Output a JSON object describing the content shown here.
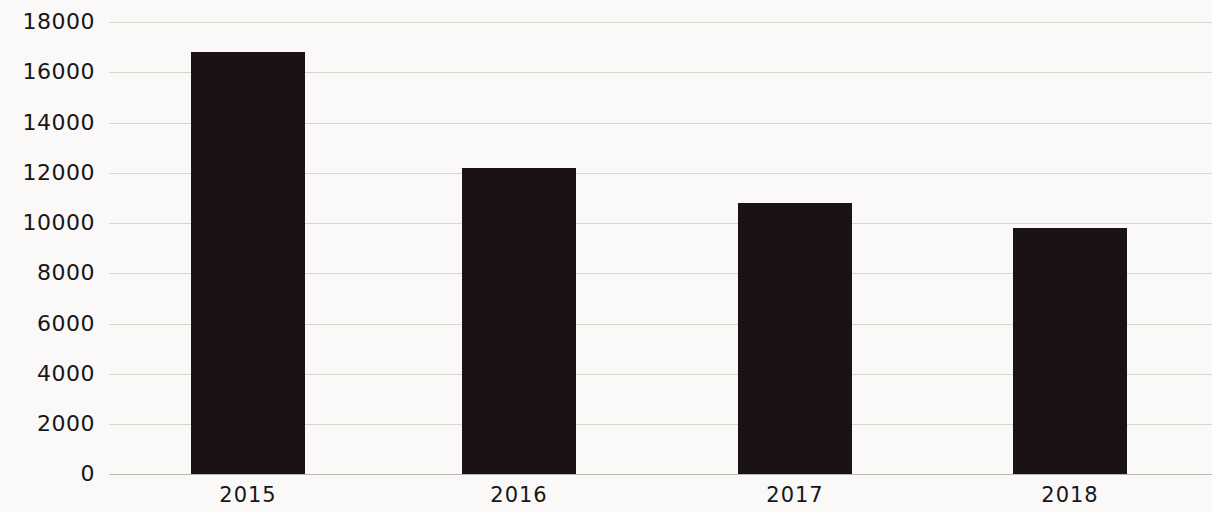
{
  "chart_data": {
    "type": "bar",
    "title": "",
    "subtitle": "",
    "xlabel": "",
    "ylabel": "",
    "categories": [
      "2015",
      "2016",
      "2017",
      "2018"
    ],
    "values": [
      16800,
      12200,
      10800,
      9800
    ],
    "series": [
      {
        "name": "",
        "values": [
          16800,
          12200,
          10800,
          9800
        ]
      }
    ],
    "ylim": [
      0,
      18000
    ],
    "y_ticks": [
      0,
      2000,
      4000,
      6000,
      8000,
      10000,
      12000,
      14000,
      16000,
      18000
    ],
    "y_tick_labels": [
      "0",
      "2000",
      "4000",
      "6000",
      "8000",
      "10000",
      "12000",
      "14000",
      "16000",
      "18000"
    ],
    "grid": true,
    "legend": null,
    "legend_position": "none",
    "annotations": [],
    "colors": {
      "bar": "#1a1215",
      "background": "#faf9f7",
      "gridline": "#d7d6d2",
      "axis_line": "#b9b8b4",
      "tick_label": "#17161a"
    }
  }
}
